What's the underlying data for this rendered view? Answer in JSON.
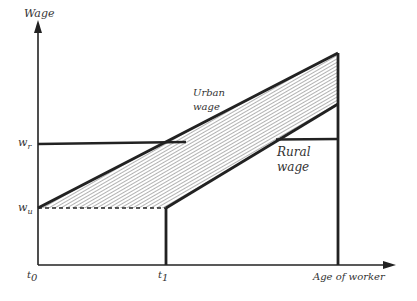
{
  "diagram": {
    "type": "economics-wage-age-profile",
    "axes": {
      "y_label": "Wage",
      "x_label": "Age of worker",
      "y_ticks": [
        {
          "main": "w",
          "sub": "r"
        },
        {
          "main": "w",
          "sub": "u"
        }
      ],
      "x_ticks": [
        {
          "main": "t",
          "sub": "0"
        },
        {
          "main": "t",
          "sub": "1"
        }
      ]
    },
    "curves": [
      {
        "name": "Urban wage",
        "line1": "Urban",
        "line2": "wage"
      },
      {
        "name": "Rural wage",
        "line1": "Rural",
        "line2": "wage"
      }
    ],
    "colors": {
      "line": "#222222",
      "hatch": "#555555",
      "text": "#333333"
    }
  }
}
